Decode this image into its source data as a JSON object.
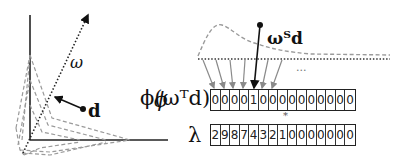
{
  "left_panel": {
    "axis_label_phi": "ϕ",
    "direction_label": "ω",
    "point_label": "d"
  },
  "right_panel": {
    "projection_label": "ωᵀd",
    "ellipsis": "...",
    "phi_row_label": "ϕ(ωᵀd)",
    "lambda_row_label": "λ",
    "multiply_symbol": "*",
    "phi_values": [
      "0",
      "0",
      "0",
      "0",
      "1",
      "0",
      "0",
      "0",
      "0",
      "0",
      "0",
      "0",
      "0",
      "0",
      "0"
    ],
    "lambda_values": [
      "2",
      "9",
      "8",
      "7",
      "4",
      "3",
      "2",
      "1",
      "0",
      "0",
      "0",
      "0",
      "0",
      "0",
      "0"
    ]
  },
  "colors": {
    "ink": "#111111",
    "dashed_gray": "#999999",
    "arrow_gray": "#8a8a8a"
  }
}
